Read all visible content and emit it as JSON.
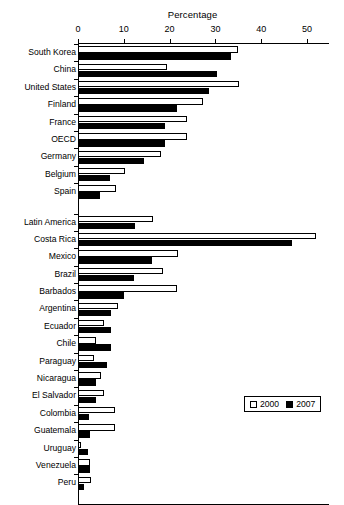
{
  "chart_data": {
    "type": "bar",
    "orientation": "horizontal",
    "title": "Percentage",
    "xlabel": "Percentage",
    "ylabel": "",
    "xlim": [
      0,
      55
    ],
    "xticks": [
      0,
      10,
      20,
      30,
      40,
      50
    ],
    "xtick_labels": [
      "0",
      "10",
      "20",
      "30",
      "40",
      "50"
    ],
    "grid": false,
    "legend_position": "bottom-right",
    "categories": [
      "South Korea",
      "China",
      "United States",
      "Finland",
      "France",
      "OECD",
      "Germany",
      "Belgium",
      "Spain",
      "Latin America",
      "Costa Rica",
      "Mexico",
      "Brazil",
      "Barbados",
      "Argentina",
      "Ecuador",
      "Chile",
      "Paraguay",
      "Nicaragua",
      "El Salvador",
      "Colombia",
      "Guatemala",
      "Uruguay",
      "Venezuela",
      "Peru"
    ],
    "group_break_after": "Spain",
    "series": [
      {
        "name": "2000",
        "color": "#ffffff",
        "values": [
          35.0,
          19.4,
          35.2,
          27.3,
          23.8,
          23.8,
          18.1,
          10.3,
          8.3,
          16.4,
          52.0,
          21.8,
          18.6,
          21.6,
          8.7,
          5.7,
          3.9,
          3.5,
          5.0,
          5.7,
          8.1,
          8.1,
          0.7,
          2.6,
          2.8
        ]
      },
      {
        "name": "2007",
        "color": "#000000",
        "values": [
          33.4,
          30.3,
          28.6,
          21.6,
          19.0,
          19.0,
          14.4,
          7.0,
          4.8,
          12.4,
          46.7,
          16.2,
          12.2,
          10.0,
          7.2,
          7.2,
          7.2,
          6.3,
          3.9,
          3.9,
          2.4,
          2.6,
          2.2,
          2.6,
          1.4
        ]
      }
    ]
  },
  "legend": {
    "items": [
      {
        "label": "2000",
        "swatch": "open-square-icon"
      },
      {
        "label": "2007",
        "swatch": "filled-square-icon"
      }
    ]
  }
}
